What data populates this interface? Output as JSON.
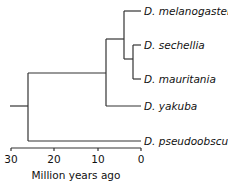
{
  "diagram": {
    "type": "phylogenetic-tree",
    "axis": {
      "title": "Million years ago",
      "ticks": [
        "30",
        "20",
        "10",
        "0"
      ],
      "tick_values": [
        30,
        20,
        10,
        0
      ],
      "range": [
        30,
        0
      ]
    },
    "taxa": [
      {
        "name": "D. melanogaster"
      },
      {
        "name": "D. sechellia"
      },
      {
        "name": "D. mauritania"
      },
      {
        "name": "D. yakuba"
      },
      {
        "name": "D. pseudoobscura"
      }
    ],
    "nodes": [
      {
        "id": "root",
        "age_mya": 26,
        "children": [
          "node_a",
          "D. pseudoobscura"
        ]
      },
      {
        "id": "node_a",
        "age_mya": 8,
        "children": [
          "node_b",
          "D. yakuba"
        ]
      },
      {
        "id": "node_b",
        "age_mya": 4,
        "children": [
          "D. melanogaster",
          "node_c"
        ]
      },
      {
        "id": "node_c",
        "age_mya": 2,
        "children": [
          "D. sechellia",
          "D. mauritania"
        ]
      }
    ]
  }
}
